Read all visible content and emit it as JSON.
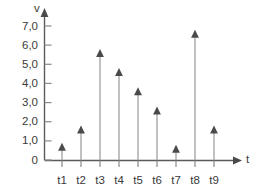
{
  "chart_data": {
    "type": "bar",
    "title": "",
    "subtitle": "",
    "xlabel": "t",
    "ylabel": "v",
    "categories": [
      "t1",
      "t2",
      "t3",
      "t4",
      "t5",
      "t6",
      "t7",
      "t8",
      "t9"
    ],
    "values": [
      0.9,
      1.8,
      5.8,
      4.8,
      3.8,
      2.8,
      0.8,
      6.8,
      1.8
    ],
    "series": [
      {
        "name": "v",
        "values": [
          0.9,
          1.8,
          5.8,
          4.8,
          3.8,
          2.8,
          0.8,
          6.8,
          1.8
        ]
      }
    ],
    "ytick_labels": [
      "0",
      "1,0",
      "2,0",
      "3,0",
      "4,0",
      "5,0",
      "6,0",
      "7,0"
    ],
    "ytick_values": [
      0,
      1,
      2,
      3,
      4,
      5,
      6,
      7
    ],
    "ylim": [
      0,
      7
    ],
    "grid": false,
    "legend": false,
    "legend_position": "none",
    "marker": "arrowhead-up",
    "stem_color": "#a0a0a0",
    "marker_color": "#4a4a4a",
    "axis_color": "#5a5a5a",
    "background_color": "#ffffff"
  },
  "axes": {
    "y_axis_name": "v",
    "x_axis_name": "t"
  }
}
